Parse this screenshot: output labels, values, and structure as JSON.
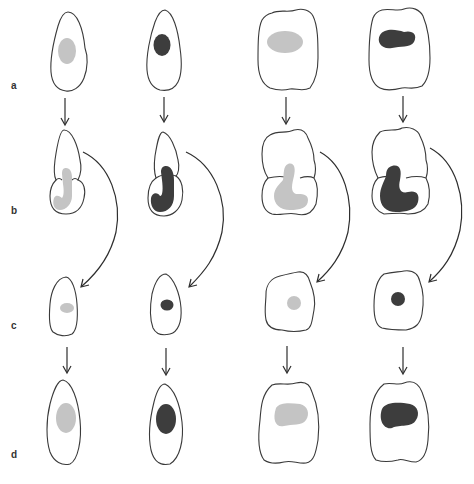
{
  "figure": {
    "row_labels": [
      "a",
      "b",
      "c",
      "d"
    ],
    "columns": 4,
    "colors": {
      "light_nucleus": "#c4c4c4",
      "dark_nucleus": "#3d3d3d",
      "outline": "#3a3a3a",
      "background": "#ffffff"
    },
    "columns_desc": [
      {
        "cell_shape": "elongated",
        "nucleus": "light"
      },
      {
        "cell_shape": "elongated",
        "nucleus": "dark"
      },
      {
        "cell_shape": "square",
        "nucleus": "light"
      },
      {
        "cell_shape": "square",
        "nucleus": "dark"
      }
    ],
    "rows_desc": [
      {
        "label": "a",
        "stage": "cell with nucleus"
      },
      {
        "label": "b",
        "stage": "dividing cell with curved nucleus"
      },
      {
        "label": "c",
        "stage": "small daughter cell with small nucleus"
      },
      {
        "label": "d",
        "stage": "grown cell with nucleus"
      }
    ]
  }
}
